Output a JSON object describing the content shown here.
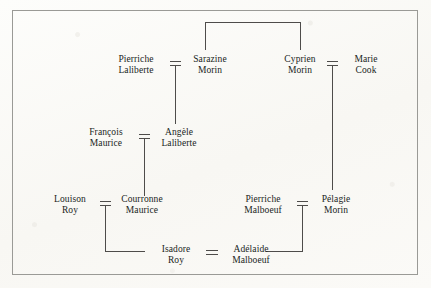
{
  "chart": {
    "type": "genealogy-tree",
    "title": "",
    "border_color": "#9a9a96",
    "line_color": "#4e4c4a",
    "text_color": "#201e1c",
    "background_color": "#fcfbf9"
  },
  "people": {
    "pierriche_laliberte": {
      "given": "Pierriche",
      "surname": "Laliberte"
    },
    "sarazine_morin": {
      "given": "Sarazine",
      "surname": "Morin"
    },
    "cyprien_morin": {
      "given": "Cyprien",
      "surname": "Morin"
    },
    "marie_cook": {
      "given": "Marie",
      "surname": "Cook"
    },
    "francois_maurice": {
      "given": "François",
      "surname": "Maurice"
    },
    "angele_laliberte": {
      "given": "Angèle",
      "surname": "Laliberte"
    },
    "louison_roy": {
      "given": "Louison",
      "surname": "Roy"
    },
    "courronne_maurice": {
      "given": "Courronne",
      "surname": "Maurice"
    },
    "pierriche_malboeuf": {
      "given": "Pierriche",
      "surname": "Malboeuf"
    },
    "pelagie_morin": {
      "given": "Pélagie",
      "surname": "Morin"
    },
    "isadore_roy": {
      "given": "Isadore",
      "surname": "Roy"
    },
    "adelaide_malboeuf": {
      "given": "Adélaide",
      "surname": "Malboeuf"
    }
  },
  "unions": [
    {
      "id": "u1",
      "left": "pierriche_laliberte",
      "right": "sarazine_morin",
      "symbol": "="
    },
    {
      "id": "u2",
      "left": "cyprien_morin",
      "right": "marie_cook",
      "symbol": "="
    },
    {
      "id": "u3",
      "left": "francois_maurice",
      "right": "angele_laliberte",
      "symbol": "="
    },
    {
      "id": "u4",
      "left": "louison_roy",
      "right": "courronne_maurice",
      "symbol": "="
    },
    {
      "id": "u5",
      "left": "pierriche_malboeuf",
      "right": "pelagie_morin",
      "symbol": "="
    },
    {
      "id": "u6",
      "left": "isadore_roy",
      "right": "adelaide_malboeuf",
      "symbol": "="
    }
  ],
  "descent": [
    {
      "from": "u1",
      "to": "angele_laliberte"
    },
    {
      "from": "u2",
      "to": "pelagie_morin"
    },
    {
      "from": "u3",
      "to": "courronne_maurice"
    },
    {
      "from": "u4",
      "to": "isadore_roy"
    },
    {
      "from": "u5",
      "to": "adelaide_malboeuf"
    }
  ],
  "sibling_links": [
    {
      "a": "sarazine_morin",
      "b": "cyprien_morin"
    }
  ]
}
